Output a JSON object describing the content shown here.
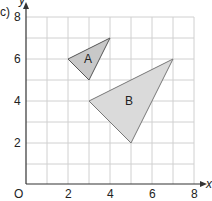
{
  "part_label": "c)",
  "axes": {
    "x_label": "x",
    "y_label": "y",
    "origin_label": "O",
    "x_ticks": [
      "2",
      "4",
      "6",
      "8"
    ],
    "y_ticks": [
      "2",
      "4",
      "6",
      "8"
    ],
    "range": [
      0,
      8
    ]
  },
  "shapes": {
    "A": {
      "label": "A",
      "vertices": [
        [
          2,
          6
        ],
        [
          4,
          7
        ],
        [
          3,
          5
        ]
      ],
      "fill": "#c8c8c8"
    },
    "B": {
      "label": "B",
      "vertices": [
        [
          3,
          4
        ],
        [
          7,
          6
        ],
        [
          5,
          2
        ]
      ],
      "fill": "#d8d8d8"
    }
  }
}
